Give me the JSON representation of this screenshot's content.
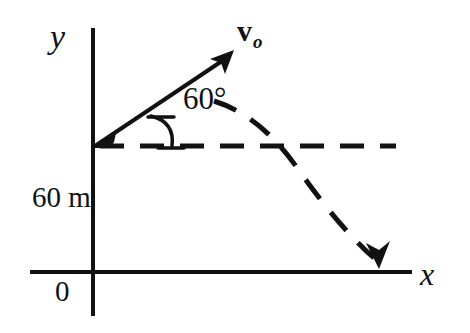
{
  "figure": {
    "type": "projectile-motion-diagram",
    "background_color": "#ffffff",
    "ink_color": "#111111",
    "axes": {
      "x_axis_label": "x",
      "y_axis_label": "y",
      "origin_label": "0",
      "x_axis_y_px": 272,
      "y_axis_x_px": 93,
      "x_axis_start_px": 30,
      "x_axis_end_px": 412,
      "y_axis_top_px": 28,
      "y_axis_bottom_px": 316
    },
    "launch_point": {
      "x_px": 95,
      "y_px": 146
    },
    "velocity_vector": {
      "label_main": "v",
      "label_subscript": "o",
      "tip_x_px": 233,
      "tip_y_px": 52,
      "style": "solid-arrow"
    },
    "angle": {
      "value": "60°",
      "measured_from": "horizontal-dashed-line",
      "arc_style": "solid-arc-with-tick"
    },
    "height": {
      "value": "60 m",
      "description": "height of launch point above x-axis"
    },
    "horizontal_reference": {
      "style": "dashed",
      "start_x_px": 100,
      "end_x_px": 396,
      "y_px": 146
    },
    "trajectory": {
      "style": "dashed-parabola",
      "arrow_end": {
        "x_px": 378,
        "y_px": 266,
        "direction": "down"
      }
    }
  }
}
